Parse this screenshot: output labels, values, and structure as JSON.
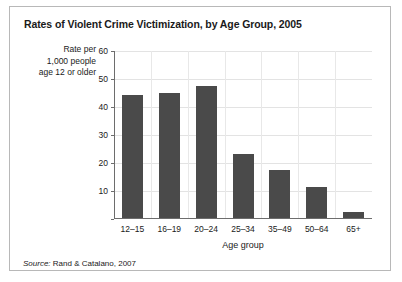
{
  "figure": {
    "title": "Rates of Violent Crime Victimization, by Age Group, 2005",
    "source_label": "Source:",
    "source_text": "Rand & Catalano, 2007",
    "y_axis_label_lines": [
      "Rate per",
      "1,000 people",
      "age 12 or older"
    ]
  },
  "colors": {
    "bar": "#4a4a4a",
    "axis": "#6d6d6d",
    "gridline": "#e3e3e3",
    "frame": "#b8b8b8",
    "text": "#1a1a1a"
  },
  "chart_data": {
    "type": "bar",
    "title": "Rates of Violent Crime Victimization, by Age Group, 2005",
    "xlabel": "Age group",
    "ylabel": "Rate per 1,000 people age 12 or older",
    "categories": [
      "12–15",
      "16–19",
      "20–24",
      "25–34",
      "35–49",
      "50–64",
      "65+"
    ],
    "values": [
      44,
      44.5,
      47,
      23,
      17,
      11,
      2
    ],
    "ylim": [
      0,
      60
    ],
    "yticks": [
      0,
      10,
      20,
      30,
      40,
      50,
      60
    ],
    "ytick_labels": [
      "",
      "10",
      "20",
      "30",
      "40",
      "50",
      "60"
    ],
    "grid": true,
    "legend": false,
    "source": "Source: Rand & Catalano, 2007"
  }
}
